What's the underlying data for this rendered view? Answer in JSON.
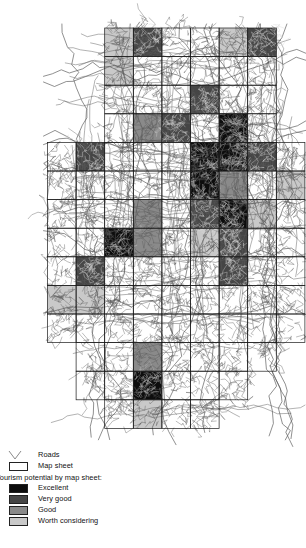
{
  "figure": {
    "background_color": "#ffffff",
    "width": 306,
    "height": 548
  },
  "map": {
    "name": "tourism-potential-map-sheets",
    "description": "Grid of map sheets over a road network, shaded by tourism potential class",
    "cell_size_px": 28.6,
    "origin_x_px": 47.5,
    "origin_y_px": 28.0,
    "road_color": "#5a5a5a",
    "sheet_outline_color": "#1a1a1a",
    "classes": {
      "excellent": "#0d0d0d",
      "very_good": "#454545",
      "good": "#8a8a8a",
      "worth_considering": "#c9c9c9",
      "none": "#ffffff"
    },
    "grid_cells": [
      {
        "col": 2,
        "row": 0,
        "class": "worth_considering"
      },
      {
        "col": 3,
        "row": 0,
        "class": "very_good"
      },
      {
        "col": 4,
        "row": 0,
        "class": "none"
      },
      {
        "col": 5,
        "row": 0,
        "class": "none"
      },
      {
        "col": 6,
        "row": 0,
        "class": "worth_considering"
      },
      {
        "col": 7,
        "row": 0,
        "class": "very_good"
      },
      {
        "col": 2,
        "row": 1,
        "class": "worth_considering"
      },
      {
        "col": 3,
        "row": 1,
        "class": "none"
      },
      {
        "col": 4,
        "row": 1,
        "class": "none"
      },
      {
        "col": 5,
        "row": 1,
        "class": "none"
      },
      {
        "col": 6,
        "row": 1,
        "class": "none"
      },
      {
        "col": 7,
        "row": 1,
        "class": "none"
      },
      {
        "col": 2,
        "row": 2,
        "class": "none"
      },
      {
        "col": 3,
        "row": 2,
        "class": "none"
      },
      {
        "col": 4,
        "row": 2,
        "class": "none"
      },
      {
        "col": 5,
        "row": 2,
        "class": "very_good"
      },
      {
        "col": 6,
        "row": 2,
        "class": "none"
      },
      {
        "col": 7,
        "row": 2,
        "class": "none"
      },
      {
        "col": 2,
        "row": 3,
        "class": "none"
      },
      {
        "col": 3,
        "row": 3,
        "class": "good"
      },
      {
        "col": 4,
        "row": 3,
        "class": "very_good"
      },
      {
        "col": 5,
        "row": 3,
        "class": "none"
      },
      {
        "col": 6,
        "row": 3,
        "class": "excellent"
      },
      {
        "col": 7,
        "row": 3,
        "class": "none"
      },
      {
        "col": 0,
        "row": 4,
        "class": "none"
      },
      {
        "col": 1,
        "row": 4,
        "class": "very_good"
      },
      {
        "col": 2,
        "row": 4,
        "class": "none"
      },
      {
        "col": 3,
        "row": 4,
        "class": "none"
      },
      {
        "col": 4,
        "row": 4,
        "class": "none"
      },
      {
        "col": 5,
        "row": 4,
        "class": "excellent"
      },
      {
        "col": 6,
        "row": 4,
        "class": "excellent"
      },
      {
        "col": 7,
        "row": 4,
        "class": "very_good"
      },
      {
        "col": 8,
        "row": 4,
        "class": "none"
      },
      {
        "col": 0,
        "row": 5,
        "class": "none"
      },
      {
        "col": 1,
        "row": 5,
        "class": "none"
      },
      {
        "col": 2,
        "row": 5,
        "class": "none"
      },
      {
        "col": 3,
        "row": 5,
        "class": "none"
      },
      {
        "col": 4,
        "row": 5,
        "class": "none"
      },
      {
        "col": 5,
        "row": 5,
        "class": "excellent"
      },
      {
        "col": 6,
        "row": 5,
        "class": "good"
      },
      {
        "col": 7,
        "row": 5,
        "class": "none"
      },
      {
        "col": 8,
        "row": 5,
        "class": "worth_considering"
      },
      {
        "col": 0,
        "row": 6,
        "class": "none"
      },
      {
        "col": 1,
        "row": 6,
        "class": "none"
      },
      {
        "col": 2,
        "row": 6,
        "class": "none"
      },
      {
        "col": 3,
        "row": 6,
        "class": "good"
      },
      {
        "col": 4,
        "row": 6,
        "class": "none"
      },
      {
        "col": 5,
        "row": 6,
        "class": "very_good"
      },
      {
        "col": 6,
        "row": 6,
        "class": "excellent"
      },
      {
        "col": 7,
        "row": 6,
        "class": "worth_considering"
      },
      {
        "col": 8,
        "row": 6,
        "class": "none"
      },
      {
        "col": 0,
        "row": 7,
        "class": "none"
      },
      {
        "col": 1,
        "row": 7,
        "class": "none"
      },
      {
        "col": 2,
        "row": 7,
        "class": "excellent"
      },
      {
        "col": 3,
        "row": 7,
        "class": "good"
      },
      {
        "col": 4,
        "row": 7,
        "class": "none"
      },
      {
        "col": 5,
        "row": 7,
        "class": "worth_considering"
      },
      {
        "col": 6,
        "row": 7,
        "class": "very_good"
      },
      {
        "col": 7,
        "row": 7,
        "class": "none"
      },
      {
        "col": 8,
        "row": 7,
        "class": "none"
      },
      {
        "col": 0,
        "row": 8,
        "class": "none"
      },
      {
        "col": 1,
        "row": 8,
        "class": "very_good"
      },
      {
        "col": 2,
        "row": 8,
        "class": "none"
      },
      {
        "col": 3,
        "row": 8,
        "class": "none"
      },
      {
        "col": 4,
        "row": 8,
        "class": "none"
      },
      {
        "col": 5,
        "row": 8,
        "class": "none"
      },
      {
        "col": 6,
        "row": 8,
        "class": "very_good"
      },
      {
        "col": 7,
        "row": 8,
        "class": "none"
      },
      {
        "col": 8,
        "row": 8,
        "class": "none"
      },
      {
        "col": 0,
        "row": 9,
        "class": "worth_considering"
      },
      {
        "col": 1,
        "row": 9,
        "class": "worth_considering"
      },
      {
        "col": 2,
        "row": 9,
        "class": "none"
      },
      {
        "col": 3,
        "row": 9,
        "class": "none"
      },
      {
        "col": 4,
        "row": 9,
        "class": "none"
      },
      {
        "col": 5,
        "row": 9,
        "class": "none"
      },
      {
        "col": 6,
        "row": 9,
        "class": "none"
      },
      {
        "col": 7,
        "row": 9,
        "class": "none"
      },
      {
        "col": 8,
        "row": 9,
        "class": "none"
      },
      {
        "col": 0,
        "row": 10,
        "class": "none"
      },
      {
        "col": 1,
        "row": 10,
        "class": "none"
      },
      {
        "col": 2,
        "row": 10,
        "class": "none"
      },
      {
        "col": 3,
        "row": 10,
        "class": "none"
      },
      {
        "col": 4,
        "row": 10,
        "class": "none"
      },
      {
        "col": 5,
        "row": 10,
        "class": "none"
      },
      {
        "col": 6,
        "row": 10,
        "class": "none"
      },
      {
        "col": 7,
        "row": 10,
        "class": "none"
      },
      {
        "col": 8,
        "row": 10,
        "class": "none"
      },
      {
        "col": 1,
        "row": 11,
        "class": "none"
      },
      {
        "col": 2,
        "row": 11,
        "class": "none"
      },
      {
        "col": 3,
        "row": 11,
        "class": "good"
      },
      {
        "col": 4,
        "row": 11,
        "class": "none"
      },
      {
        "col": 5,
        "row": 11,
        "class": "none"
      },
      {
        "col": 6,
        "row": 11,
        "class": "none"
      },
      {
        "col": 7,
        "row": 11,
        "class": "none"
      },
      {
        "col": 1,
        "row": 12,
        "class": "none"
      },
      {
        "col": 2,
        "row": 12,
        "class": "none"
      },
      {
        "col": 3,
        "row": 12,
        "class": "excellent"
      },
      {
        "col": 4,
        "row": 12,
        "class": "none"
      },
      {
        "col": 5,
        "row": 12,
        "class": "none"
      },
      {
        "col": 6,
        "row": 12,
        "class": "none"
      },
      {
        "col": 2,
        "row": 13,
        "class": "none"
      },
      {
        "col": 3,
        "row": 13,
        "class": "worth_considering"
      },
      {
        "col": 4,
        "row": 13,
        "class": "none"
      },
      {
        "col": 5,
        "row": 13,
        "class": "none"
      }
    ]
  },
  "legend": {
    "name": "map-legend",
    "roads_label": "Roads",
    "map_sheet_label": "Map sheet",
    "title": "Tourism potential by map sheet:",
    "classes": [
      {
        "label": "Excellent",
        "color": "#0d0d0d"
      },
      {
        "label": "Very good",
        "color": "#454545"
      },
      {
        "label": "Good",
        "color": "#8a8a8a"
      },
      {
        "label": "Worth considering",
        "color": "#c9c9c9"
      }
    ]
  }
}
